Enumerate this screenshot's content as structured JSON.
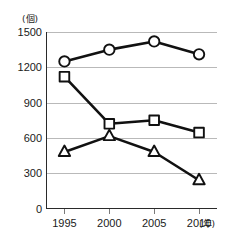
{
  "chart_data": {
    "type": "line",
    "title": "",
    "subtitle": "",
    "xlabel": "(年)",
    "ylabel": "(個)",
    "x": [
      1995,
      2000,
      2005,
      2010
    ],
    "categories": [
      "1995",
      "2000",
      "2005",
      "2010"
    ],
    "xlim": [
      1993,
      2012
    ],
    "ylim": [
      0,
      1500
    ],
    "yticks": [
      0,
      300,
      600,
      900,
      1200,
      1500
    ],
    "ytick_labels": [
      "0",
      "300",
      "600",
      "900",
      "1200",
      "1500"
    ],
    "xtick_labels": [
      "1995",
      "2000",
      "2005",
      "2010"
    ],
    "grid": "horizontal",
    "legend": "none",
    "series": [
      {
        "name": "circle-series",
        "marker": "circle",
        "marker_style": "open",
        "color": "#111111",
        "values": [
          1250,
          1350,
          1420,
          1310
        ]
      },
      {
        "name": "square-series",
        "marker": "square",
        "marker_style": "open",
        "color": "#111111",
        "values": [
          1120,
          720,
          750,
          645
        ]
      },
      {
        "name": "triangle-series",
        "marker": "triangle",
        "marker_style": "open",
        "color": "#111111",
        "values": [
          480,
          615,
          480,
          240
        ]
      }
    ]
  },
  "axes": {
    "y_unit_label": "(個)",
    "x_unit_label": "(年)"
  },
  "colors": {
    "background": "#ffffff",
    "gridline": "#b9b9b9",
    "axis": "#2a2a2a",
    "series": "#111111",
    "marker_fill": "#ffffff",
    "text": "#1a1a1a"
  }
}
